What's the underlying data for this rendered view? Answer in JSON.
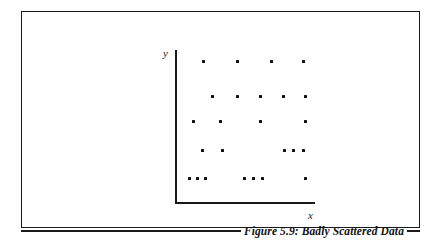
{
  "figure": {
    "caption": "Figure 5.9: Badly Scattered Data",
    "border_color": "#1a1a1a",
    "background_color": "#ffffff"
  },
  "chart_data": {
    "type": "scatter",
    "title": "Figure 5.9: Badly Scattered Data",
    "xlabel": "x",
    "ylabel": "y",
    "grid": false,
    "legend": null,
    "axis_ticks": [],
    "marker_color": "#101010",
    "marker_size_px": 3,
    "xlim": [
      0,
      145
    ],
    "ylim": [
      0,
      160
    ],
    "points": [
      {
        "x": 28,
        "y": 147
      },
      {
        "x": 62,
        "y": 147
      },
      {
        "x": 96,
        "y": 147
      },
      {
        "x": 128,
        "y": 147
      },
      {
        "x": 37,
        "y": 112
      },
      {
        "x": 62,
        "y": 112
      },
      {
        "x": 85,
        "y": 112
      },
      {
        "x": 108,
        "y": 112
      },
      {
        "x": 130,
        "y": 112
      },
      {
        "x": 18,
        "y": 87
      },
      {
        "x": 45,
        "y": 87
      },
      {
        "x": 85,
        "y": 87
      },
      {
        "x": 130,
        "y": 87
      },
      {
        "x": 27,
        "y": 58
      },
      {
        "x": 47,
        "y": 58
      },
      {
        "x": 109,
        "y": 58
      },
      {
        "x": 118,
        "y": 58
      },
      {
        "x": 128,
        "y": 58
      },
      {
        "x": 14,
        "y": 30
      },
      {
        "x": 22,
        "y": 30
      },
      {
        "x": 30,
        "y": 30
      },
      {
        "x": 69,
        "y": 30
      },
      {
        "x": 78,
        "y": 30
      },
      {
        "x": 87,
        "y": 30
      },
      {
        "x": 130,
        "y": 30
      }
    ]
  }
}
